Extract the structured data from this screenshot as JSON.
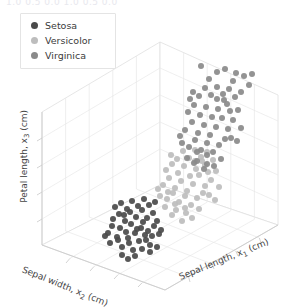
{
  "figure": {
    "background_color": "#ffffff",
    "top_partial_text": "1.0 0.5 0.0   1.0 0.5 0.0",
    "grid_color": "#e6e6e6",
    "pane_edge_color": "#d8d8d8"
  },
  "legend": {
    "border_color": "#e4e4e4",
    "background": "#ffffff",
    "items": [
      {
        "label": "Setosa",
        "color": "#4a4a4a"
      },
      {
        "label": "Versicolor",
        "color": "#bdbdbd"
      },
      {
        "label": "Virginica",
        "color": "#8a8a8a"
      }
    ]
  },
  "axes": {
    "x_label": "Sepal length, x",
    "x_sub": "1",
    "x_units": " (cm)",
    "y_label": "Sepal width, x",
    "y_sub": "2",
    "y_units": " (cm)",
    "z_label": "Petal length, x",
    "z_sub": "3",
    "z_units": " (cm)"
  },
  "chart_data": {
    "type": "scatter",
    "projection": "3d",
    "title": "",
    "xlabel": "Sepal length, x1 (cm)",
    "ylabel": "Sepal width, x2 (cm)",
    "zlabel": "Petal length, x3 (cm)",
    "grid": true,
    "legend_position": "upper left",
    "marker_size": 6,
    "series": [
      {
        "name": "Setosa",
        "color": "#4a4a4a",
        "points": [
          [
            110,
            243
          ],
          [
            117,
            237
          ],
          [
            122,
            247
          ],
          [
            128,
            238
          ],
          [
            133,
            250
          ],
          [
            139,
            241
          ],
          [
            145,
            235
          ],
          [
            150,
            245
          ],
          [
            120,
            228
          ],
          [
            126,
            232
          ],
          [
            131,
            224
          ],
          [
            137,
            229
          ],
          [
            143,
            222
          ],
          [
            148,
            231
          ],
          [
            154,
            226
          ],
          [
            159,
            234
          ],
          [
            113,
            219
          ],
          [
            119,
            214
          ],
          [
            125,
            221
          ],
          [
            130,
            212
          ],
          [
            136,
            217
          ],
          [
            142,
            210
          ],
          [
            147,
            218
          ],
          [
            153,
            213
          ],
          [
            115,
            207
          ],
          [
            121,
            203
          ],
          [
            127,
            209
          ],
          [
            132,
            201
          ],
          [
            138,
            206
          ],
          [
            144,
            199
          ],
          [
            149,
            205
          ],
          [
            155,
            202
          ],
          [
            108,
            233
          ],
          [
            112,
            226
          ],
          [
            118,
            240
          ],
          [
            124,
            215
          ],
          [
            129,
            243
          ],
          [
            135,
            233
          ],
          [
            141,
            228
          ],
          [
            146,
            240
          ],
          [
            152,
            236
          ],
          [
            157,
            221
          ],
          [
            161,
            230
          ],
          [
            105,
            236
          ],
          [
            157,
            247
          ],
          [
            150,
            252
          ],
          [
            135,
            256
          ],
          [
            128,
            259
          ],
          [
            122,
            255
          ],
          [
            142,
            249
          ]
        ]
      },
      {
        "name": "Versicolor",
        "color": "#bdbdbd",
        "points": [
          [
            163,
            185
          ],
          [
            169,
            178
          ],
          [
            175,
            188
          ],
          [
            181,
            181
          ],
          [
            187,
            191
          ],
          [
            193,
            184
          ],
          [
            199,
            175
          ],
          [
            205,
            186
          ],
          [
            166,
            170
          ],
          [
            172,
            164
          ],
          [
            178,
            173
          ],
          [
            184,
            166
          ],
          [
            190,
            176
          ],
          [
            196,
            169
          ],
          [
            202,
            161
          ],
          [
            208,
            172
          ],
          [
            160,
            196
          ],
          [
            167,
            199
          ],
          [
            173,
            193
          ],
          [
            179,
            202
          ],
          [
            185,
            196
          ],
          [
            191,
            205
          ],
          [
            197,
            198
          ],
          [
            203,
            193
          ],
          [
            171,
            155
          ],
          [
            177,
            159
          ],
          [
            183,
            151
          ],
          [
            189,
            158
          ],
          [
            195,
            150
          ],
          [
            201,
            157
          ],
          [
            207,
            152
          ],
          [
            213,
            160
          ],
          [
            165,
            207
          ],
          [
            176,
            210
          ],
          [
            186,
            213
          ],
          [
            158,
            189
          ],
          [
            211,
            180
          ],
          [
            216,
            171
          ],
          [
            209,
            195
          ],
          [
            199,
            209
          ],
          [
            192,
            218
          ],
          [
            182,
            221
          ],
          [
            172,
            215
          ],
          [
            219,
            187
          ],
          [
            205,
            165
          ],
          [
            195,
            161
          ],
          [
            185,
            208
          ],
          [
            175,
            204
          ],
          [
            215,
            200
          ],
          [
            168,
            192
          ]
        ]
      },
      {
        "name": "Virginica",
        "color": "#8a8a8a",
        "points": [
          [
            185,
            130
          ],
          [
            192,
            122
          ],
          [
            198,
            133
          ],
          [
            204,
            125
          ],
          [
            210,
            135
          ],
          [
            216,
            127
          ],
          [
            222,
            118
          ],
          [
            228,
            129
          ],
          [
            188,
            112
          ],
          [
            194,
            105
          ],
          [
            200,
            115
          ],
          [
            206,
            107
          ],
          [
            212,
            117
          ],
          [
            218,
            109
          ],
          [
            224,
            100
          ],
          [
            230,
            111
          ],
          [
            182,
            143
          ],
          [
            189,
            147
          ],
          [
            195,
            140
          ],
          [
            201,
            150
          ],
          [
            207,
            143
          ],
          [
            213,
            152
          ],
          [
            219,
            145
          ],
          [
            225,
            139
          ],
          [
            193,
            92
          ],
          [
            199,
            96
          ],
          [
            205,
            88
          ],
          [
            211,
            95
          ],
          [
            217,
            87
          ],
          [
            223,
            94
          ],
          [
            229,
            89
          ],
          [
            235,
            97
          ],
          [
            187,
            158
          ],
          [
            197,
            161
          ],
          [
            207,
            155
          ],
          [
            180,
            136
          ],
          [
            233,
            120
          ],
          [
            238,
            110
          ],
          [
            231,
            138
          ],
          [
            221,
            159
          ],
          [
            214,
            166
          ],
          [
            204,
            169
          ],
          [
            194,
            163
          ],
          [
            241,
            128
          ],
          [
            227,
            104
          ],
          [
            217,
            99
          ],
          [
            207,
            164
          ],
          [
            197,
            152
          ],
          [
            237,
            141
          ],
          [
            190,
            99
          ],
          [
            236,
            73
          ],
          [
            244,
            76
          ],
          [
            252,
            74
          ],
          [
            249,
            85
          ],
          [
            241,
            92
          ],
          [
            233,
            81
          ],
          [
            225,
            69
          ],
          [
            217,
            72
          ],
          [
            209,
            79
          ],
          [
            201,
            66
          ]
        ]
      }
    ]
  }
}
